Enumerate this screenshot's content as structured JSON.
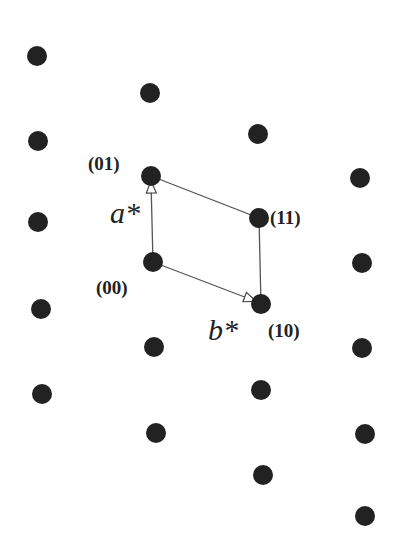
{
  "diagram": {
    "type": "reciprocal-lattice",
    "point_color": "#222222",
    "line_color": "#555555",
    "points": [
      {
        "x": 37,
        "y": 56
      },
      {
        "x": 150,
        "y": 93
      },
      {
        "x": 38,
        "y": 141
      },
      {
        "x": 258,
        "y": 134
      },
      {
        "x": 151,
        "y": 176
      },
      {
        "x": 38,
        "y": 222
      },
      {
        "x": 360,
        "y": 178
      },
      {
        "x": 259,
        "y": 218
      },
      {
        "x": 153,
        "y": 262
      },
      {
        "x": 362,
        "y": 263
      },
      {
        "x": 41,
        "y": 309
      },
      {
        "x": 261,
        "y": 304
      },
      {
        "x": 154,
        "y": 347
      },
      {
        "x": 362,
        "y": 348
      },
      {
        "x": 42,
        "y": 394
      },
      {
        "x": 261,
        "y": 390
      },
      {
        "x": 156,
        "y": 433
      },
      {
        "x": 365,
        "y": 434
      },
      {
        "x": 263,
        "y": 475
      },
      {
        "x": 365,
        "y": 516
      }
    ],
    "labels": {
      "p00": "(00)",
      "p01": "(01)",
      "p10": "(10)",
      "p11": "(11)",
      "a_star": "a*",
      "b_star": "b*"
    }
  }
}
